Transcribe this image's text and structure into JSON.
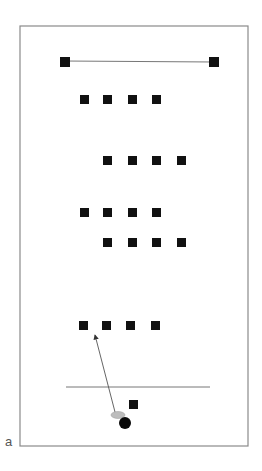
{
  "panel_label": "a",
  "colors": {
    "frame": "#8a8a8a",
    "marker": "#111111",
    "line": "#777777",
    "ellipse": "#bdbdbd",
    "ball": "#0a0a0a"
  },
  "frame": {
    "x": 20,
    "y": 26,
    "w": 228,
    "h": 420
  },
  "top_line": {
    "x1": 64,
    "y1": 61,
    "x2": 214,
    "y2": 62
  },
  "top_markers": [
    {
      "x": 60,
      "y": 57,
      "size": 10
    },
    {
      "x": 209,
      "y": 57,
      "size": 10
    }
  ],
  "marker_rows": [
    {
      "y": 95,
      "xs": [
        80,
        103,
        128,
        152
      ]
    },
    {
      "y": 156,
      "xs": [
        103,
        128,
        152,
        177
      ]
    },
    {
      "y": 208,
      "xs": [
        80,
        103,
        128,
        152
      ]
    },
    {
      "y": 238,
      "xs": [
        103,
        128,
        152,
        177
      ]
    },
    {
      "y": 321,
      "xs": [
        79,
        102,
        126,
        151
      ]
    }
  ],
  "marker_size": 9,
  "baseline": {
    "x1": 66,
    "y1": 387,
    "x2": 210,
    "y2": 387
  },
  "single_marker": {
    "x": 129,
    "y": 400,
    "size": 9
  },
  "arrow": {
    "x1": 115,
    "y1": 412,
    "x2": 95,
    "y2": 335
  },
  "ellipse": {
    "cx": 118,
    "cy": 415,
    "rx": 7,
    "ry": 3.5
  },
  "ball": {
    "cx": 125,
    "cy": 423,
    "r": 6
  }
}
